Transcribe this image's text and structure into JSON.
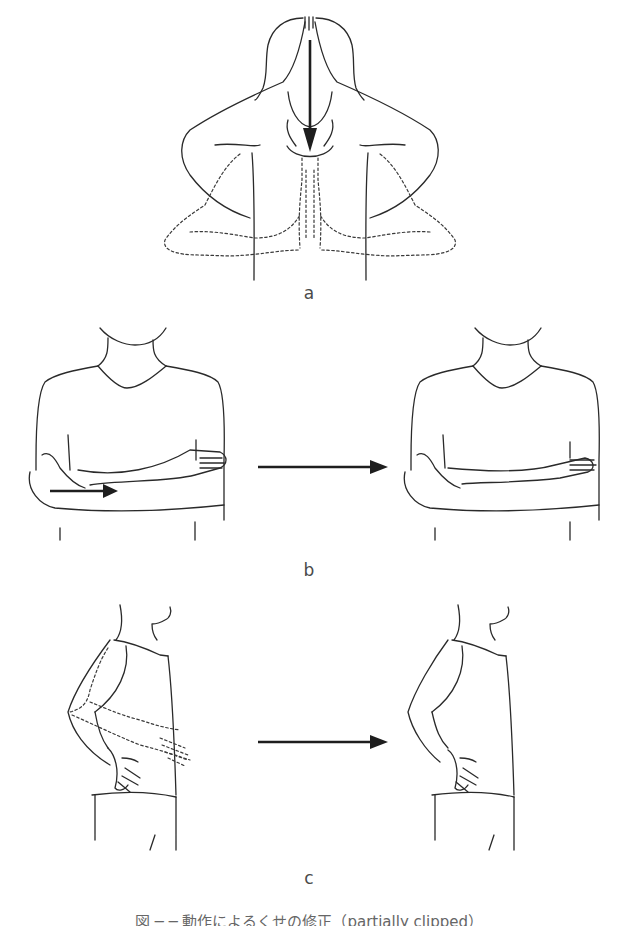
{
  "figure": {
    "panels": [
      {
        "id": "a",
        "label": "a",
        "description": "Front view: palms pressed together above head, drawn down to chest (dashed end position), downward arrow"
      },
      {
        "id": "b",
        "label": "b",
        "description": "Front view: arms crossed, forearm slides across body (arrow) — start and end positions"
      },
      {
        "id": "c",
        "label": "c",
        "description": "Side view: hand moves to hip (dashed start positions) — start and end positions"
      }
    ],
    "transition_arrows": [
      "b: left to right",
      "c: left to right"
    ],
    "caption": "図 ─ ─ 動作によるくせの修正（partially clipped）"
  }
}
